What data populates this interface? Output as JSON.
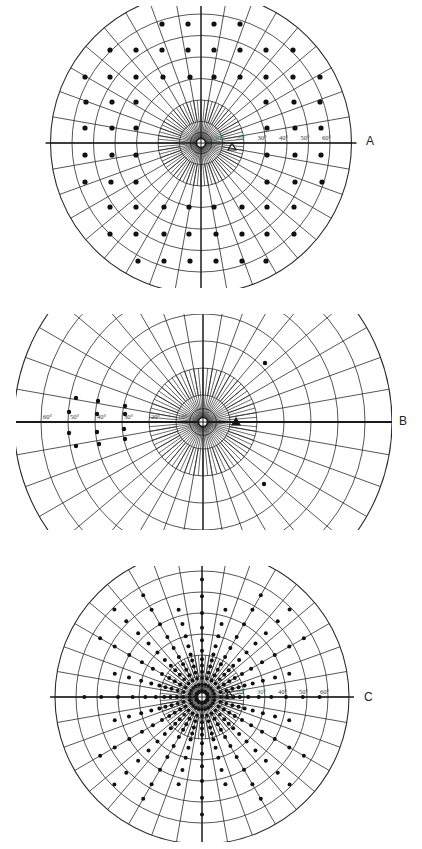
{
  "panels": [
    {
      "id": "A",
      "label": "A",
      "label_pos": [
        370,
        143
      ],
      "center": [
        201,
        143
      ],
      "px_per_10deg": 21.5,
      "outer_deg": 70,
      "clip": {
        "x": 40,
        "y": 6,
        "w": 320,
        "h": 282
      },
      "rings_deg": [
        5,
        10,
        20,
        30,
        40,
        50,
        60,
        70
      ],
      "meridian_step_deg": 10,
      "inner_meridian_step_deg": 5,
      "scale_labels": [
        "10°",
        "20°",
        "30°",
        "40°",
        "50°",
        "60°"
      ],
      "scale_side": "right",
      "blind_spot": [
        232,
        147
      ],
      "dots": [
        [
          162,
          24
        ],
        [
          188,
          24
        ],
        [
          214,
          24
        ],
        [
          240,
          24
        ],
        [
          110,
          50
        ],
        [
          136,
          50
        ],
        [
          162,
          50
        ],
        [
          188,
          50
        ],
        [
          214,
          50
        ],
        [
          240,
          50
        ],
        [
          266,
          50
        ],
        [
          293,
          50
        ],
        [
          85,
          77
        ],
        [
          110,
          77
        ],
        [
          136,
          77
        ],
        [
          163,
          77
        ],
        [
          190,
          77
        ],
        [
          214,
          77
        ],
        [
          240,
          77
        ],
        [
          266,
          77
        ],
        [
          293,
          77
        ],
        [
          320,
          77
        ],
        [
          86,
          102
        ],
        [
          112,
          102
        ],
        [
          136,
          102
        ],
        [
          266,
          102
        ],
        [
          294,
          102
        ],
        [
          320,
          102
        ],
        [
          85,
          128
        ],
        [
          112,
          128
        ],
        [
          136,
          128
        ],
        [
          267,
          128
        ],
        [
          295,
          128
        ],
        [
          321,
          128
        ],
        [
          85,
          155
        ],
        [
          112,
          155
        ],
        [
          136,
          155
        ],
        [
          267,
          155
        ],
        [
          295,
          155
        ],
        [
          321,
          155
        ],
        [
          85,
          182
        ],
        [
          111,
          182
        ],
        [
          136,
          182
        ],
        [
          267,
          182
        ],
        [
          295,
          182
        ],
        [
          322,
          182
        ],
        [
          110,
          207
        ],
        [
          136,
          207
        ],
        [
          164,
          207
        ],
        [
          189,
          207
        ],
        [
          214,
          207
        ],
        [
          242,
          207
        ],
        [
          267,
          207
        ],
        [
          294,
          207
        ],
        [
          110,
          234
        ],
        [
          136,
          234
        ],
        [
          164,
          234
        ],
        [
          189,
          234
        ],
        [
          216,
          234
        ],
        [
          242,
          234
        ],
        [
          267,
          234
        ],
        [
          294,
          234
        ],
        [
          138,
          261
        ],
        [
          164,
          261
        ],
        [
          190,
          261
        ],
        [
          216,
          261
        ],
        [
          242,
          261
        ],
        [
          266,
          261
        ]
      ]
    },
    {
      "id": "B",
      "label": "B",
      "label_pos": [
        403,
        423
      ],
      "center": [
        203,
        422
      ],
      "px_per_10deg": 27,
      "outer_deg": 70,
      "clip": {
        "x": 16,
        "y": 314,
        "w": 376,
        "h": 216
      },
      "rings_deg": [
        5,
        10,
        20,
        30,
        40,
        50,
        60,
        70
      ],
      "meridian_step_deg": 10,
      "inner_meridian_step_deg": 5,
      "scale_labels": [
        "10°",
        "20°",
        "30°",
        "40°",
        "50°",
        "60°"
      ],
      "scale_side": "left",
      "blind_spot": [
        236,
        422
      ],
      "dots": [
        [
          76,
          398
        ],
        [
          69,
          412
        ],
        [
          69,
          433
        ],
        [
          76,
          446
        ],
        [
          98,
          401
        ],
        [
          97,
          414
        ],
        [
          97,
          432
        ],
        [
          99,
          444
        ],
        [
          125,
          406
        ],
        [
          125,
          414
        ],
        [
          124,
          429
        ],
        [
          125,
          439
        ],
        [
          265,
          363
        ],
        [
          264,
          484
        ]
      ]
    },
    {
      "id": "C",
      "label": "C",
      "label_pos": [
        368,
        699
      ],
      "center": [
        202,
        697
      ],
      "px_per_10deg": 21,
      "outer_deg": 70,
      "clip": {
        "x": 50,
        "y": 566,
        "w": 310,
        "h": 276
      },
      "rings_deg": [
        5,
        10,
        20,
        30,
        40,
        50,
        60,
        70
      ],
      "meridian_step_deg": 10,
      "inner_meridian_step_deg": 5,
      "scale_labels": [
        "20°",
        "30°",
        "40°",
        "50°",
        "60°"
      ],
      "scale_side": "right",
      "blind_spot": [
        229,
        695
      ],
      "radial_dots": {
        "meridians_deg": [
          0,
          15,
          30,
          45,
          60,
          75,
          90,
          105,
          120,
          135,
          150,
          165,
          180,
          195,
          210,
          225,
          240,
          255,
          270,
          285,
          300,
          315,
          330,
          345
        ],
        "radii_deg": [
          3,
          6,
          9,
          12,
          15,
          18,
          22,
          27,
          33,
          40,
          48,
          56
        ]
      }
    }
  ],
  "colors": {
    "line": "#1a1a1a",
    "grid": "#2b2b2b",
    "dot": "#111111",
    "label_text": "#333333",
    "accent_label": "#1f7a6a"
  }
}
